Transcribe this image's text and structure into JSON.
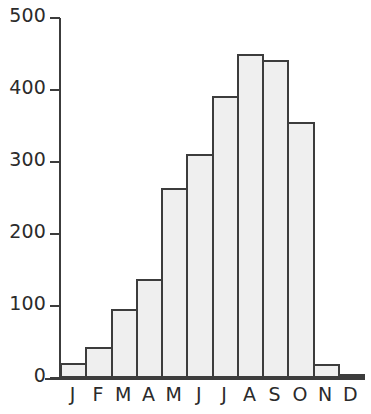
{
  "chart_data": {
    "type": "bar",
    "title": "",
    "subtitle": "",
    "xlabel": "",
    "ylabel": "",
    "categories": [
      "J",
      "F",
      "M",
      "A",
      "M",
      "J",
      "J",
      "A",
      "S",
      "O",
      "N",
      "D"
    ],
    "category_names": [
      "January",
      "February",
      "March",
      "April",
      "May",
      "June",
      "July",
      "August",
      "September",
      "October",
      "November",
      "December"
    ],
    "values": [
      21,
      43,
      96,
      137,
      264,
      311,
      392,
      450,
      441,
      356,
      19,
      3
    ],
    "ylim": [
      0,
      500
    ],
    "yticks": [
      0,
      100,
      200,
      300,
      400,
      500
    ],
    "ytick_labels": [
      "0",
      "100",
      "200",
      "300",
      "400",
      "500"
    ],
    "xticks": [
      "J",
      "F",
      "M",
      "A",
      "M",
      "J",
      "J",
      "A",
      "S",
      "O",
      "N",
      "D"
    ],
    "grid": false,
    "legend": null,
    "legend_position": "none",
    "annotations": [],
    "bar_fill_color": "#efefef",
    "bar_edge_color": "#3c3c3c",
    "axis_color": "#3c3c3c",
    "background_color": "#ffffff",
    "bar_gap": 0
  }
}
